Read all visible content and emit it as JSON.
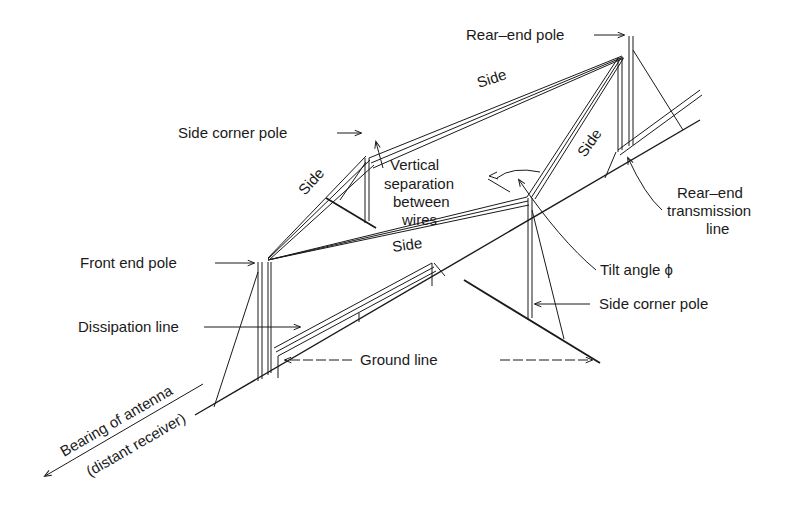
{
  "diagram": {
    "labels": {
      "rear_end_pole": "Rear–end pole",
      "side_top": "Side",
      "side_corner_pole_top": "Side corner pole",
      "vertical_separation_1": "Vertical",
      "vertical_separation_2": "separation",
      "vertical_separation_3": "between",
      "vertical_separation_4": "wires",
      "side_left": "Side",
      "side_right": "Side",
      "side_bottom": "Side",
      "rear_end_tl_1": "Rear–end",
      "rear_end_tl_2": "transmission",
      "rear_end_tl_3": "line",
      "front_end_pole": "Front end pole",
      "tilt_angle": "Tilt angle ϕ",
      "dissipation_line": "Dissipation line",
      "side_corner_pole_bottom": "Side corner pole",
      "ground_line": "Ground line",
      "bearing_1": "Bearing of antenna",
      "bearing_2": "(distant receiver)"
    },
    "colors": {
      "ink": "#1a1a1a",
      "background": "#ffffff"
    }
  }
}
